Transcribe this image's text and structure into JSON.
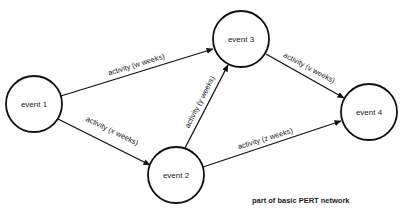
{
  "diagram": {
    "title": "part of basic PERT network",
    "nodes": [
      {
        "id": "e1",
        "label": "event 1",
        "cx": 34,
        "cy": 104,
        "r": 28
      },
      {
        "id": "e2",
        "label": "event 2",
        "cx": 176,
        "cy": 175,
        "r": 28
      },
      {
        "id": "e3",
        "label": "event 3",
        "cx": 241,
        "cy": 39,
        "r": 28
      },
      {
        "id": "e4",
        "label": "event 4",
        "cx": 369,
        "cy": 112,
        "r": 28
      }
    ],
    "edges": [
      {
        "from": "e1",
        "to": "e3",
        "label": "activity (w weeks)"
      },
      {
        "from": "e1",
        "to": "e2",
        "label": "activity (x weeks)"
      },
      {
        "from": "e2",
        "to": "e3",
        "label": "activity (y weeks)"
      },
      {
        "from": "e3",
        "to": "e4",
        "label": "activity (v weeks)"
      },
      {
        "from": "e2",
        "to": "e4",
        "label": "activity (z weeks)"
      }
    ],
    "colors": {
      "stroke": "#111111",
      "text": "#222222",
      "background": "#ffffff"
    }
  }
}
